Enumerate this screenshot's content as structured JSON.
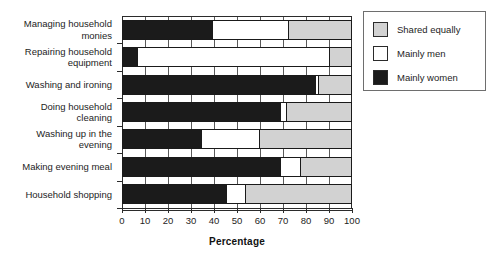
{
  "chart_data": {
    "type": "bar",
    "orientation": "horizontal",
    "stacked": true,
    "title": "",
    "xlabel": "Percentage",
    "ylabel": "",
    "xlim": [
      0,
      100
    ],
    "xticks": [
      0,
      10,
      20,
      30,
      40,
      50,
      60,
      70,
      80,
      90,
      100
    ],
    "grid": true,
    "legend_position": "right-top",
    "categories": [
      "Managing household\nmonies",
      "Repairing household\nequipment",
      "Washing and ironing",
      "Doing household\ncleaning",
      "Washing up in the\nevening",
      "Making evening meal",
      "Household shopping"
    ],
    "series": [
      {
        "name": "Mainly women",
        "color": "#1b1b1b",
        "values": [
          39,
          6,
          84,
          69,
          34,
          69,
          45
        ]
      },
      {
        "name": "Mainly men",
        "color": "#ffffff",
        "values": [
          34,
          85,
          2,
          3,
          26,
          9,
          9
        ]
      },
      {
        "name": "Shared equally",
        "color": "#d2d2d2",
        "values": [
          27,
          9,
          14,
          28,
          40,
          22,
          46
        ]
      }
    ],
    "legend": [
      {
        "label": "Shared equally",
        "color": "#d2d2d2"
      },
      {
        "label": "Mainly men",
        "color": "#ffffff"
      },
      {
        "label": "Mainly women",
        "color": "#1b1b1b"
      }
    ]
  }
}
